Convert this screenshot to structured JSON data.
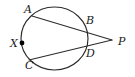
{
  "figure": {
    "type": "circle-geometry-diagram",
    "stroke_color": "#2b2b2b",
    "background_color": "#ffffff",
    "point_marker_color": "#000000",
    "circle": {
      "center_x": 54.5,
      "center_y": 38.5,
      "radius_x": 33.5,
      "radius_y": 31.5
    },
    "labels": [
      {
        "text": "A",
        "x": 24,
        "y": 4
      },
      {
        "text": "B",
        "x": 86,
        "y": 15
      },
      {
        "text": "P",
        "x": 118,
        "y": 36
      },
      {
        "text": "X",
        "x": 10,
        "y": 38
      },
      {
        "text": "D",
        "x": 86,
        "y": 48
      },
      {
        "text": "C",
        "x": 25,
        "y": 60
      }
    ],
    "points": [
      {
        "name": "A",
        "x": 32,
        "y": 16
      },
      {
        "name": "B",
        "x": 84,
        "y": 28
      },
      {
        "name": "P",
        "x": 112,
        "y": 40
      },
      {
        "name": "X",
        "x": 22,
        "y": 43
      },
      {
        "name": "D",
        "x": 84,
        "y": 48
      },
      {
        "name": "C",
        "x": 29,
        "y": 60
      }
    ],
    "segments": [
      {
        "name": "secant-A-B-P",
        "from": "A",
        "to": "P"
      },
      {
        "name": "secant-C-D-P",
        "from": "C",
        "to": "P"
      }
    ],
    "marked_point": {
      "name": "X",
      "x": 22,
      "y": 43,
      "radius": 2.4
    }
  }
}
